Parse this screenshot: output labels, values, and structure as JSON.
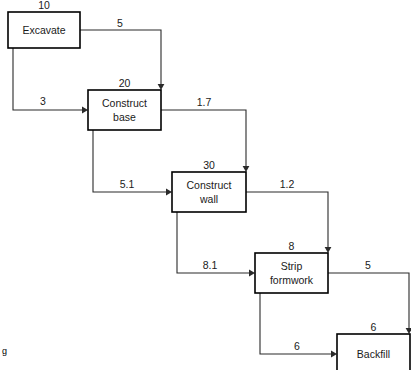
{
  "diagram": {
    "corner_mark": "g",
    "colors": {
      "background": "#ffffff",
      "box_stroke": "#000000",
      "edge_stroke": "#2a2a2a",
      "text": "#1a1a1a"
    },
    "nodes": [
      {
        "id": "excavate",
        "label_line1": "Excavate",
        "label_line2": "",
        "duration": "10",
        "x": 8,
        "y": 12,
        "w": 72,
        "h": 36
      },
      {
        "id": "construct-base",
        "label_line1": "Construct",
        "label_line2": "base",
        "duration": "20",
        "x": 88,
        "y": 90,
        "w": 73,
        "h": 40
      },
      {
        "id": "construct-wall",
        "label_line1": "Construct",
        "label_line2": "wall",
        "duration": "30",
        "x": 172,
        "y": 172,
        "w": 74,
        "h": 40
      },
      {
        "id": "strip-formwork",
        "label_line1": "Strip",
        "label_line2": "formwork",
        "duration": "8",
        "x": 255,
        "y": 253,
        "w": 73,
        "h": 40
      },
      {
        "id": "backfill",
        "label_line1": "Backfill",
        "label_line2": "",
        "duration": "6",
        "x": 337,
        "y": 334,
        "w": 73,
        "h": 40
      }
    ],
    "edges": [
      {
        "id": "excavate-to-base-top",
        "from": "excavate",
        "to": "construct-base",
        "lag": "5",
        "label_x": 120,
        "label_y": 27,
        "path": "M 80 30 L 161 30 L 161 86",
        "arrow_x": 161,
        "arrow_y": 90,
        "arrow_dir": "down"
      },
      {
        "id": "excavate-to-base-left",
        "from": "excavate",
        "to": "construct-base",
        "lag": "3",
        "label_x": 43,
        "label_y": 105,
        "path": "M 13 48 L 13 110 L 84 110",
        "arrow_x": 88,
        "arrow_y": 110,
        "arrow_dir": "right"
      },
      {
        "id": "base-to-wall-top",
        "from": "construct-base",
        "to": "construct-wall",
        "lag": "1.7",
        "label_x": 204,
        "label_y": 106,
        "path": "M 161 110 L 246 110 L 246 168",
        "arrow_x": 246,
        "arrow_y": 172,
        "arrow_dir": "down"
      },
      {
        "id": "base-to-wall-left",
        "from": "construct-base",
        "to": "construct-wall",
        "lag": "5.1",
        "label_x": 127,
        "label_y": 188,
        "path": "M 93 130 L 93 192 L 168 192",
        "arrow_x": 172,
        "arrow_y": 192,
        "arrow_dir": "right"
      },
      {
        "id": "wall-to-strip-top",
        "from": "construct-wall",
        "to": "strip-formwork",
        "lag": "1.2",
        "label_x": 287,
        "label_y": 188,
        "path": "M 246 192 L 328 192 L 328 249",
        "arrow_x": 328,
        "arrow_y": 253,
        "arrow_dir": "down"
      },
      {
        "id": "wall-to-strip-left",
        "from": "construct-wall",
        "to": "strip-formwork",
        "lag": "8.1",
        "label_x": 210,
        "label_y": 269,
        "path": "M 177 212 L 177 273 L 251 273",
        "arrow_x": 255,
        "arrow_y": 273,
        "arrow_dir": "right"
      },
      {
        "id": "strip-to-backfill-top",
        "from": "strip-formwork",
        "to": "backfill",
        "lag": "5",
        "label_x": 368,
        "label_y": 269,
        "path": "M 328 273 L 409 273 L 409 330",
        "arrow_x": 409,
        "arrow_y": 334,
        "arrow_dir": "down"
      },
      {
        "id": "strip-to-backfill-left",
        "from": "strip-formwork",
        "to": "backfill",
        "lag": "6",
        "label_x": 297,
        "label_y": 350,
        "path": "M 260 293 L 260 354 L 333 354",
        "arrow_x": 337,
        "arrow_y": 354,
        "arrow_dir": "right"
      }
    ]
  }
}
